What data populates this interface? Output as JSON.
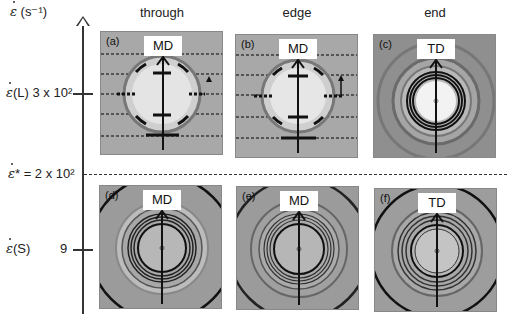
{
  "axis": {
    "title_symbol": "ε",
    "title_unit": "(s⁻¹)",
    "tick_top_label_sym": "ε",
    "tick_top_label": "(L) 3 x 10²",
    "critical_label_sym": "ε",
    "critical_label": "* = 2 x 10²",
    "tick_bottom_label_sym": "ε",
    "tick_bottom_label": "(S)",
    "tick_bottom_value": "9"
  },
  "columns": [
    "through",
    "edge",
    "end"
  ],
  "panels": [
    {
      "id": "(a)",
      "direction": "MD",
      "type": "oriented",
      "arrowhead_marker": "triangle"
    },
    {
      "id": "(b)",
      "direction": "MD",
      "type": "oriented",
      "arrowhead_marker": "arrow"
    },
    {
      "id": "(c)",
      "direction": "TD",
      "type": "rings-bright"
    },
    {
      "id": "(d)",
      "direction": "MD",
      "type": "rings"
    },
    {
      "id": "(e)",
      "direction": "MD",
      "type": "rings"
    },
    {
      "id": "(f)",
      "direction": "TD",
      "type": "rings"
    }
  ],
  "colors": {
    "axis": "#333333",
    "panel_bg": "#9a9a9a",
    "ring": "#1a1a1a"
  }
}
